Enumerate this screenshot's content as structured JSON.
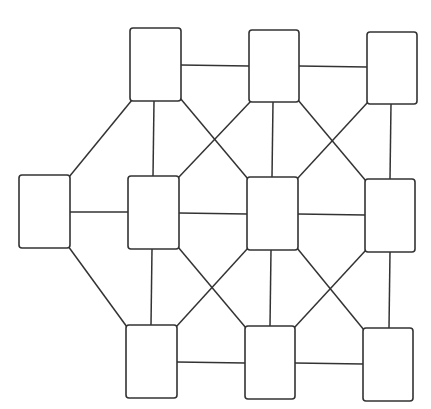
{
  "title_fragment": "",
  "style": {
    "stroke_color": "#333333",
    "node_fill": "#ffffff",
    "background": "#ffffff"
  },
  "nodes": [
    {
      "id": "TL",
      "label": "",
      "x": 130,
      "y": 28,
      "w": 51,
      "h": 73
    },
    {
      "id": "TM",
      "label": "",
      "x": 249,
      "y": 30,
      "w": 50,
      "h": 72
    },
    {
      "id": "TR",
      "label": "",
      "x": 367,
      "y": 32,
      "w": 50,
      "h": 72
    },
    {
      "id": "L",
      "label": "",
      "x": 19,
      "y": 175,
      "w": 51,
      "h": 73
    },
    {
      "id": "ML",
      "label": "",
      "x": 128,
      "y": 176,
      "w": 51,
      "h": 73
    },
    {
      "id": "C",
      "label": "",
      "x": 247,
      "y": 177,
      "w": 51,
      "h": 73
    },
    {
      "id": "MR",
      "label": "",
      "x": 365,
      "y": 179,
      "w": 50,
      "h": 73
    },
    {
      "id": "BL",
      "label": "",
      "x": 126,
      "y": 325,
      "w": 51,
      "h": 73
    },
    {
      "id": "BM",
      "label": "",
      "x": 245,
      "y": 326,
      "w": 50,
      "h": 73
    },
    {
      "id": "BR",
      "label": "",
      "x": 363,
      "y": 328,
      "w": 50,
      "h": 73
    }
  ],
  "edges": [
    {
      "from": "TL",
      "to": "TM",
      "x1": 181,
      "y1": 65,
      "x2": 249,
      "y2": 66
    },
    {
      "from": "TM",
      "to": "TR",
      "x1": 299,
      "y1": 66,
      "x2": 367,
      "y2": 67
    },
    {
      "from": "TL",
      "to": "L",
      "x1": 132,
      "y1": 100,
      "x2": 69,
      "y2": 177
    },
    {
      "from": "TL",
      "to": "ML",
      "x1": 154,
      "y1": 101,
      "x2": 153,
      "y2": 176
    },
    {
      "from": "TL",
      "to": "C",
      "x1": 180,
      "y1": 98,
      "x2": 248,
      "y2": 179
    },
    {
      "from": "TM",
      "to": "ML",
      "x1": 251,
      "y1": 101,
      "x2": 178,
      "y2": 178
    },
    {
      "from": "TM",
      "to": "C",
      "x1": 273,
      "y1": 102,
      "x2": 272,
      "y2": 177
    },
    {
      "from": "TM",
      "to": "MR",
      "x1": 298,
      "y1": 100,
      "x2": 366,
      "y2": 181
    },
    {
      "from": "TR",
      "to": "C",
      "x1": 368,
      "y1": 102,
      "x2": 297,
      "y2": 179
    },
    {
      "from": "TR",
      "to": "MR",
      "x1": 391,
      "y1": 104,
      "x2": 390,
      "y2": 179
    },
    {
      "from": "L",
      "to": "ML",
      "x1": 70,
      "y1": 212,
      "x2": 128,
      "y2": 212
    },
    {
      "from": "ML",
      "to": "C",
      "x1": 179,
      "y1": 213,
      "x2": 247,
      "y2": 214
    },
    {
      "from": "C",
      "to": "MR",
      "x1": 298,
      "y1": 214,
      "x2": 365,
      "y2": 215
    },
    {
      "from": "L",
      "to": "BL",
      "x1": 68,
      "y1": 246,
      "x2": 127,
      "y2": 327
    },
    {
      "from": "ML",
      "to": "BL",
      "x1": 152,
      "y1": 249,
      "x2": 151,
      "y2": 325
    },
    {
      "from": "ML",
      "to": "BM",
      "x1": 178,
      "y1": 247,
      "x2": 246,
      "y2": 328
    },
    {
      "from": "C",
      "to": "BL",
      "x1": 248,
      "y1": 248,
      "x2": 176,
      "y2": 327
    },
    {
      "from": "C",
      "to": "BM",
      "x1": 271,
      "y1": 250,
      "x2": 270,
      "y2": 326
    },
    {
      "from": "C",
      "to": "BR",
      "x1": 297,
      "y1": 248,
      "x2": 364,
      "y2": 330
    },
    {
      "from": "MR",
      "to": "BM",
      "x1": 366,
      "y1": 250,
      "x2": 294,
      "y2": 328
    },
    {
      "from": "MR",
      "to": "BR",
      "x1": 390,
      "y1": 252,
      "x2": 389,
      "y2": 328
    },
    {
      "from": "BL",
      "to": "BM",
      "x1": 177,
      "y1": 362,
      "x2": 245,
      "y2": 363
    },
    {
      "from": "BM",
      "to": "BR",
      "x1": 295,
      "y1": 363,
      "x2": 363,
      "y2": 364
    }
  ]
}
